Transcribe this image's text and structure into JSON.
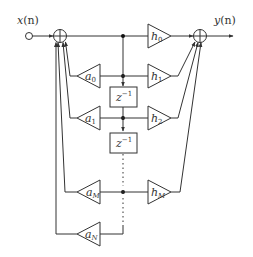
{
  "diagram": {
    "input_label": "x(n)",
    "output_label": "y(n)",
    "input_signal": {
      "name": "x",
      "arg": "(n)"
    },
    "output_signal": {
      "name": "y",
      "arg": "(n)"
    },
    "delay_label": {
      "base": "z",
      "exp": "−1"
    },
    "feedback_gains": [
      {
        "base": "a",
        "sub": "0"
      },
      {
        "base": "a",
        "sub": "1"
      },
      {
        "base": "a",
        "sub": "M"
      },
      {
        "base": "a",
        "sub": "N"
      }
    ],
    "feedforward_gains": [
      {
        "base": "h",
        "sub": "0"
      },
      {
        "base": "h",
        "sub": "1"
      },
      {
        "base": "h",
        "sub": "2"
      },
      {
        "base": "h",
        "sub": "M"
      }
    ],
    "adders": [
      {
        "role": "input-summer",
        "symbol": "+"
      },
      {
        "role": "output-summer",
        "symbol": "+"
      }
    ]
  }
}
